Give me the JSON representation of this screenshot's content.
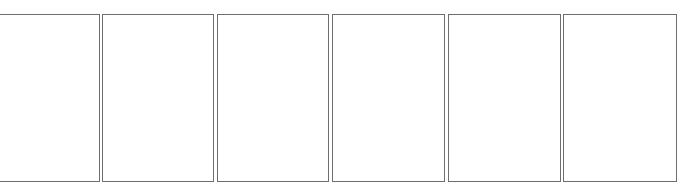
{
  "panels": [
    {
      "label": ""
    },
    {
      "label": ""
    },
    {
      "label": ""
    },
    {
      "label": ""
    },
    {
      "label": ""
    },
    {
      "label": ""
    }
  ],
  "colors": {
    "border": "#6e6e6e",
    "background": "#ffffff"
  }
}
